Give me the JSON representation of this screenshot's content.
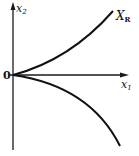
{
  "diagram": {
    "axes": {
      "vertical": {
        "label": "x",
        "subscript": "2"
      },
      "horizontal": {
        "label": "x",
        "subscript": "1"
      },
      "origin": "0"
    },
    "curves": [
      {
        "name": "upper-curve",
        "label": "X",
        "subscript": "R",
        "direction": "up-right"
      },
      {
        "name": "lower-curve",
        "label": "",
        "direction": "down-right"
      }
    ],
    "colors": {
      "background": "#ffffff",
      "stroke": "#111111"
    }
  }
}
